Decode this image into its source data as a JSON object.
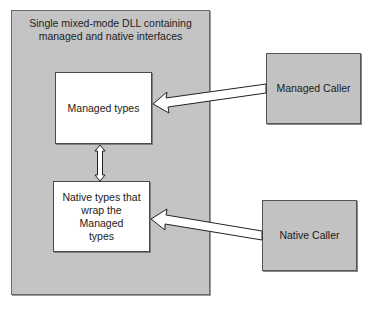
{
  "diagram": {
    "container": {
      "title": "Single mixed-mode DLL containing managed and native interfaces",
      "title_line1": "Single mixed-mode DLL containing",
      "title_line2": "managed and native interfaces",
      "fill": "#c4c4c4"
    },
    "nodes": [
      {
        "id": "managed-types",
        "label": "Managed types",
        "fill": "#ffffff"
      },
      {
        "id": "native-types",
        "label": "Native types that wrap the Managed types",
        "label_line1": "Native types that",
        "label_line2": "wrap the Managed",
        "label_line3": "types",
        "fill": "#ffffff"
      },
      {
        "id": "managed-caller",
        "label": "Managed Caller",
        "fill": "#c2c2c2"
      },
      {
        "id": "native-caller",
        "label": "Native Caller",
        "fill": "#c2c2c2"
      }
    ],
    "edges": [
      {
        "from": "managed-caller",
        "to": "managed-types",
        "style": "hollow-block-arrow"
      },
      {
        "from": "native-caller",
        "to": "native-types",
        "style": "hollow-block-arrow"
      },
      {
        "from": "managed-types",
        "to": "native-types",
        "style": "hollow-double-arrow"
      }
    ]
  }
}
